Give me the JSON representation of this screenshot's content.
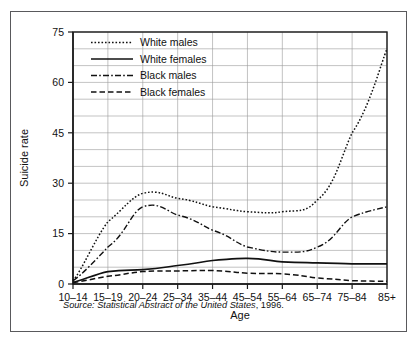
{
  "chart_data": {
    "type": "line",
    "title": "",
    "xlabel": "Age",
    "ylabel": "Suicide rate",
    "categories": [
      "10–14",
      "15–19",
      "20–24",
      "25–34",
      "35–44",
      "45–54",
      "55–64",
      "65–74",
      "75–84",
      "85+"
    ],
    "ylim": [
      0,
      75
    ],
    "yticks": [
      0,
      15,
      30,
      45,
      60,
      75
    ],
    "ytick_labels": [
      "0",
      "15",
      "30",
      "45",
      "60",
      "75"
    ],
    "minor_gridline_step": 5,
    "grid": true,
    "legend_position": "top-left inside",
    "series": [
      {
        "name": "White males",
        "style": "dotted",
        "values": [
          1.0,
          18.5,
          27.0,
          25.5,
          23.0,
          21.5,
          21.5,
          25.0,
          45.0,
          70.0
        ]
      },
      {
        "name": "White females",
        "style": "solid",
        "values": [
          0.5,
          3.7,
          4.3,
          5.5,
          7.0,
          7.6,
          6.6,
          6.3,
          6.0,
          6.0
        ]
      },
      {
        "name": "Black males",
        "style": "dash-dot",
        "values": [
          1.0,
          11.0,
          23.0,
          20.5,
          16.0,
          11.0,
          9.5,
          11.0,
          20.0,
          23.0
        ]
      },
      {
        "name": "Black females",
        "style": "dashed",
        "values": [
          0.4,
          2.3,
          3.7,
          3.9,
          4.0,
          3.2,
          3.0,
          1.8,
          1.0,
          0.8
        ]
      }
    ],
    "source": {
      "prefix": "Source: Statistical Abstract of the United States",
      "suffix": ", 1996."
    }
  },
  "axis": {
    "x_title": "Age",
    "y_title": "Suicide rate"
  },
  "legend": {
    "entries": [
      {
        "label": "White males"
      },
      {
        "label": "White females"
      },
      {
        "label": "Black males"
      },
      {
        "label": "Black females"
      }
    ]
  }
}
